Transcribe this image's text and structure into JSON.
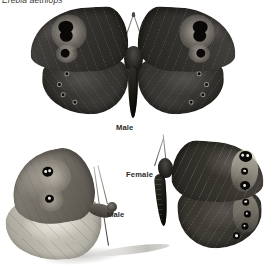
{
  "plate": {
    "species_name": "Erebia aethiops",
    "background_color": "#ffffff",
    "width": 274,
    "height": 276
  },
  "specimens": [
    {
      "id": "male-dorsal",
      "label": "Male",
      "view": "dorsal, wings spread",
      "position": "top-centre",
      "wing_color": "#3b3936",
      "markings": "paired black ocelli with pale halo on each forewing; row of small ringed ocelli along hindwing margin"
    },
    {
      "id": "male-ventral",
      "label": "Male",
      "view": "ventral, side profile with wings closed",
      "position": "lower-left",
      "wing_color": "#a7a49a",
      "markings": "two white-pupilled black eyespots on forewing; pale grey-green hindwing band"
    },
    {
      "id": "female-dorsal",
      "label": "Female",
      "view": "dorsal, right wings spread",
      "position": "lower-right",
      "wing_color": "#38352f",
      "markings": "cream-ochre marginal band bearing black white-pupilled ocelli"
    }
  ],
  "labels": {
    "male_top": "Male",
    "female": "Female",
    "male_side": "Male"
  },
  "colors": {
    "background": "#ffffff",
    "wing_dark": "#38352f",
    "wing_pale": "#c2bfb3",
    "ocellus": "#0a0908",
    "ocellus_pupil": "#e8e6e0",
    "text": "#2b2b2b"
  }
}
